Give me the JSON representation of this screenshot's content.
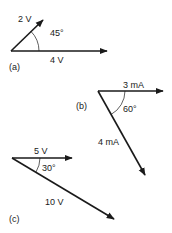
{
  "figure": {
    "panels": [
      {
        "id": "a",
        "label": "(a)",
        "vectors": [
          {
            "name": "2 V",
            "magnitude": 2,
            "unit": "V",
            "angle_deg": 45
          },
          {
            "name": "4 V",
            "magnitude": 4,
            "unit": "V",
            "angle_deg": 0
          }
        ],
        "angle_label": "45°"
      },
      {
        "id": "b",
        "label": "(b)",
        "vectors": [
          {
            "name": "3 mA",
            "magnitude": 3,
            "unit": "mA",
            "angle_deg": 0
          },
          {
            "name": "4 mA",
            "magnitude": 4,
            "unit": "mA",
            "angle_deg": -60
          }
        ],
        "angle_label": "60°"
      },
      {
        "id": "c",
        "label": "(c)",
        "vectors": [
          {
            "name": "5 V",
            "magnitude": 5,
            "unit": "V",
            "angle_deg": 0
          },
          {
            "name": "10 V",
            "magnitude": 10,
            "unit": "V",
            "angle_deg": -30
          }
        ],
        "angle_label": "30°"
      }
    ],
    "colors": {
      "stroke": "#1a1a1a",
      "background": "#ffffff"
    }
  }
}
